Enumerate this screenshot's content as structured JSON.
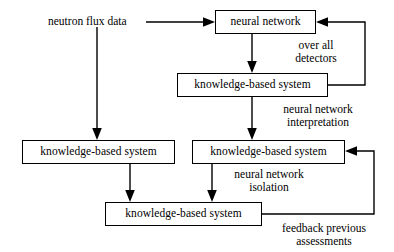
{
  "diagram": {
    "type": "flowchart",
    "background_color": "#ffffff",
    "line_color": "#000000",
    "text_color": "#000000",
    "nodes": [
      {
        "id": "neural-network",
        "label": "neural network",
        "x": 215,
        "y": 10,
        "width": 101,
        "height": 24
      },
      {
        "id": "kbs-top",
        "label": "knowledge-based system",
        "x": 177,
        "y": 73,
        "width": 151,
        "height": 24
      },
      {
        "id": "kbs-left",
        "label": "knowledge-based system",
        "x": 22,
        "y": 140,
        "width": 153,
        "height": 24
      },
      {
        "id": "kbs-right",
        "label": "knowledge-based system",
        "x": 192,
        "y": 140,
        "width": 153,
        "height": 24
      },
      {
        "id": "kbs-bottom",
        "label": "knowledge-based system",
        "x": 105,
        "y": 202,
        "width": 157,
        "height": 24
      }
    ],
    "labels": [
      {
        "id": "input-label",
        "text": "neutron flux data",
        "lines": [
          "neutron flux data"
        ],
        "x": 48,
        "y": 15,
        "width": 92
      },
      {
        "id": "over-all-detectors-label",
        "text": "over all detectors",
        "lines": [
          "over all",
          "detectors"
        ],
        "x": 285,
        "y": 39,
        "width": 62
      },
      {
        "id": "nn-interpretation-label",
        "text": "neural network interpretation",
        "lines": [
          "neural network",
          "interpretation"
        ],
        "x": 276,
        "y": 103,
        "width": 84
      },
      {
        "id": "nn-isolation-label",
        "text": "neural network isolation",
        "lines": [
          "neural network",
          "isolation"
        ],
        "x": 227,
        "y": 168,
        "width": 84
      },
      {
        "id": "feedback-label",
        "text": "feedback previous assessments",
        "lines": [
          "feedback previous",
          "assessments"
        ],
        "x": 268,
        "y": 222,
        "width": 112
      }
    ],
    "edges": [
      {
        "id": "input-to-neural-network",
        "from": "neutron flux data",
        "to": "neural network",
        "path": "M 146 22 L 211 22",
        "arrow_at": [
          215,
          22
        ],
        "arrow_dir": "right"
      },
      {
        "id": "input-branch-down",
        "from": "neutron flux data",
        "to": "knowledge-based system (left)",
        "path": "M 97 27 L 97 134",
        "arrow_at": [
          97,
          140
        ],
        "arrow_dir": "down"
      },
      {
        "id": "neural-network-to-kbs-top",
        "from": "neural network",
        "to": "knowledge-based system (top)",
        "path": "M 252 34 L 252 67",
        "arrow_at": [
          252,
          73
        ],
        "arrow_dir": "down"
      },
      {
        "id": "kbs-top-feedback-over-all-detectors",
        "from": "knowledge-based system (top)",
        "to": "neural network",
        "path": "M 328 85 L 365 85 L 365 22 L 322 22",
        "arrow_at": [
          316,
          22
        ],
        "arrow_dir": "left"
      },
      {
        "id": "kbs-top-to-kbs-right",
        "from": "knowledge-based system (top)",
        "to": "knowledge-based system (right)",
        "path": "M 252 97 L 252 134",
        "arrow_at": [
          252,
          140
        ],
        "arrow_dir": "down"
      },
      {
        "id": "kbs-left-to-kbs-bottom",
        "from": "knowledge-based system (left)",
        "to": "knowledge-based system (bottom)",
        "path": "M 130 164 L 130 196",
        "arrow_at": [
          130,
          202
        ],
        "arrow_dir": "down"
      },
      {
        "id": "kbs-right-to-kbs-bottom",
        "from": "knowledge-based system (right)",
        "to": "knowledge-based system (bottom)",
        "path": "M 212 164 L 212 196",
        "arrow_at": [
          212,
          202
        ],
        "arrow_dir": "down"
      },
      {
        "id": "kbs-bottom-feedback-previous-assessments",
        "from": "knowledge-based system (bottom)",
        "to": "knowledge-based system (right)",
        "path": "M 262 214 L 374 214 L 374 151 L 351 151",
        "arrow_at": [
          345,
          151
        ],
        "arrow_dir": "left"
      }
    ]
  }
}
